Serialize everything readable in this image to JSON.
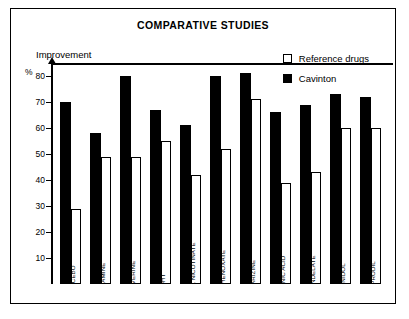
{
  "chart_data": {
    "type": "bar",
    "title": "COMPARATIVE STUDIES",
    "ylabel": "Improvement",
    "yunit": "%",
    "xlabel": "",
    "ylim": [
      0,
      85
    ],
    "yticks": [
      10,
      20,
      30,
      40,
      50,
      60,
      70,
      80
    ],
    "grid": false,
    "legend_position": "top-right",
    "categories": [
      "PLACEBO",
      "VINCAMINE",
      "PAPAVERINE",
      "DHT",
      "XANTHINOL NICOTINATE",
      "MECLOPHENOXATE",
      "CINNARIZINE",
      "NICOTINIC ACID",
      "CYCLANDELATE",
      "DIFENIDOL",
      "IFENPRODIL"
    ],
    "series": [
      {
        "name": "Cavinton",
        "color": "#000000",
        "style": "filled",
        "values": [
          70,
          58,
          80,
          67,
          61,
          80,
          81,
          66,
          69,
          73,
          72
        ]
      },
      {
        "name": "Reference drugs",
        "color": "#ffffff",
        "style": "hollow",
        "values": [
          29,
          49,
          49,
          55,
          42,
          52,
          71,
          39,
          43,
          60,
          60
        ]
      }
    ]
  },
  "legend": {
    "items": [
      {
        "label": "Reference drugs",
        "swatch": "hollow"
      },
      {
        "label": "Cavinton",
        "swatch": "filled"
      }
    ]
  }
}
